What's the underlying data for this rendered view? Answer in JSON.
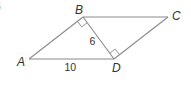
{
  "figure": {
    "problem_number_fragment": "6",
    "shape": "parallelogram ABCD with diagonal BD",
    "vertices": {
      "A": {
        "label": "A",
        "x": 29,
        "y": 59
      },
      "B": {
        "label": "B",
        "x": 83,
        "y": 17
      },
      "C": {
        "label": "C",
        "x": 168,
        "y": 17
      },
      "D": {
        "label": "D",
        "x": 114,
        "y": 59
      }
    },
    "segments": [
      "AB",
      "BC",
      "CD",
      "DA",
      "BD"
    ],
    "measurements": {
      "BD": "6",
      "AD": "10"
    },
    "right_angles": [
      "ABD",
      "BDC"
    ],
    "colors": {
      "line": "#8a8a8a",
      "text": "#333333",
      "background": "#ffffff"
    }
  }
}
